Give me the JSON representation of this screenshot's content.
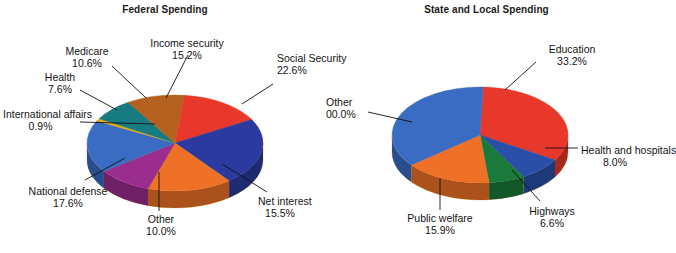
{
  "figure": {
    "background": "#ffffff",
    "rim_color": "#f3dfa9",
    "rim_shadow": "#e4c882",
    "leader_color": "#111111"
  },
  "charts": [
    {
      "id": "federal",
      "title": "Federal Spending",
      "type": "pie",
      "center_x": 175,
      "center_y": 143,
      "radius_x": 88,
      "radius_y": 48,
      "depth": 17,
      "start_angle": -84,
      "slices": [
        {
          "label": "Income security",
          "pct": "15.2%",
          "value": 15.2,
          "color": "#e8382b"
        },
        {
          "label": "Social Security",
          "pct": "22.6%",
          "value": 22.6,
          "color": "#2a3a9e"
        },
        {
          "label": "Net interest",
          "pct": "15.5%",
          "value": 15.5,
          "color": "#ee7127"
        },
        {
          "label": "Other",
          "pct": "10.0%",
          "value": 10.0,
          "color": "#9b2d8e"
        },
        {
          "label": "National defense",
          "pct": "17.6%",
          "value": 17.6,
          "color": "#3a6cc4"
        },
        {
          "label": "International affairs",
          "pct": "0.9%",
          "value": 0.9,
          "color": "#e8a90d"
        },
        {
          "label": "Health",
          "pct": "7.6%",
          "value": 7.6,
          "color": "#177b82"
        },
        {
          "label": "Medicare",
          "pct": "10.6%",
          "value": 10.6,
          "color": "#b4611f"
        }
      ]
    },
    {
      "id": "state",
      "title": "State and Local Spending",
      "type": "pie",
      "center_x": 480,
      "center_y": 135,
      "radius_x": 88,
      "radius_y": 48,
      "depth": 17,
      "start_angle": -88,
      "slices": [
        {
          "label": "Education",
          "pct": "33.2%",
          "value": 33.2,
          "color": "#e8382b"
        },
        {
          "label": "Health and hospitals",
          "pct": "8.0%",
          "value": 8.0,
          "color": "#2a4fa8"
        },
        {
          "label": "Highways",
          "pct": "6.6%",
          "value": 6.6,
          "color": "#1a7a3c"
        },
        {
          "label": "Public welfare",
          "pct": "15.9%",
          "value": 15.9,
          "color": "#ee7127"
        },
        {
          "label": "Other",
          "pct": "00.0%",
          "value": 36.3,
          "color": "#3a6cc4"
        }
      ]
    }
  ],
  "callouts": {
    "federal": [
      {
        "name": "income-security",
        "label": "Income security",
        "pct": "15.2%",
        "x": 139,
        "y": 38,
        "w": 96,
        "align": "center"
      },
      {
        "name": "social-security",
        "label": "Social Security",
        "pct": "22.6%",
        "x": 277,
        "y": 53,
        "w": 48,
        "align": "left"
      },
      {
        "name": "medicare",
        "label": "Medicare",
        "pct": "10.6%",
        "x": 56,
        "y": 46,
        "w": 62,
        "align": "center"
      },
      {
        "name": "health",
        "label": "Health",
        "pct": "7.6%",
        "x": 35,
        "y": 72,
        "w": 50,
        "align": "center"
      },
      {
        "name": "international-affairs",
        "label": "International affairs",
        "pct": "0.9%",
        "x": 3,
        "y": 109,
        "w": 75,
        "align": "center"
      },
      {
        "name": "national-defense",
        "label": "National defense",
        "pct": "17.6%",
        "x": 22,
        "y": 186,
        "w": 92,
        "align": "center"
      },
      {
        "name": "other",
        "label": "Other",
        "pct": "10.0%",
        "x": 139,
        "y": 214,
        "w": 44,
        "align": "center"
      },
      {
        "name": "net-interest",
        "label": "Net interest",
        "pct": "15.5%",
        "x": 258,
        "y": 196,
        "w": 44,
        "align": "center"
      }
    ],
    "state": [
      {
        "name": "education",
        "label": "Education",
        "pct": "33.2%",
        "x": 539,
        "y": 44,
        "w": 66,
        "align": "center"
      },
      {
        "name": "other",
        "label": "Other",
        "pct": "00.0%",
        "x": 326,
        "y": 97,
        "w": 44,
        "align": "left"
      },
      {
        "name": "health-and-hospitals",
        "label": "Health and hospitals",
        "pct": "8.0%",
        "x": 581,
        "y": 145,
        "w": 68,
        "align": "center"
      },
      {
        "name": "highways",
        "label": "Highways",
        "pct": "6.6%",
        "x": 524,
        "y": 206,
        "w": 56,
        "align": "center"
      },
      {
        "name": "public-welfare",
        "label": "Public welfare",
        "pct": "15.9%",
        "x": 400,
        "y": 213,
        "w": 80,
        "align": "center"
      }
    ]
  },
  "leader_lines": {
    "federal": [
      {
        "name": "leader-income-security",
        "x1": 188,
        "y1": 55,
        "x2": 166,
        "y2": 98
      },
      {
        "name": "leader-social-security",
        "x1": 273,
        "y1": 84,
        "x2": 242,
        "y2": 104
      },
      {
        "name": "leader-medicare",
        "x1": 112,
        "y1": 66,
        "x2": 146,
        "y2": 98
      },
      {
        "name": "leader-health",
        "x1": 80,
        "y1": 90,
        "x2": 117,
        "y2": 110
      },
      {
        "name": "leader-international",
        "x1": 80,
        "y1": 122,
        "x2": 155,
        "y2": 124
      },
      {
        "name": "leader-national-defense",
        "x1": 85,
        "y1": 180,
        "x2": 125,
        "y2": 158
      },
      {
        "name": "leader-other",
        "x1": 159,
        "y1": 211,
        "x2": 159,
        "y2": 172
      },
      {
        "name": "leader-net-interest",
        "x1": 267,
        "y1": 192,
        "x2": 222,
        "y2": 164
      }
    ],
    "state": [
      {
        "name": "leader-education",
        "x1": 536,
        "y1": 62,
        "x2": 505,
        "y2": 90
      },
      {
        "name": "leader-other",
        "x1": 368,
        "y1": 112,
        "x2": 412,
        "y2": 122
      },
      {
        "name": "leader-health-hospitals",
        "x1": 578,
        "y1": 148,
        "x2": 545,
        "y2": 148
      },
      {
        "name": "leader-highways",
        "x1": 540,
        "y1": 201,
        "x2": 512,
        "y2": 170
      },
      {
        "name": "leader-public-welfare",
        "x1": 440,
        "y1": 210,
        "x2": 440,
        "y2": 178
      }
    ]
  },
  "chart_data": [
    {
      "type": "pie",
      "title": "Federal Spending",
      "categories": [
        "Income security",
        "Social Security",
        "Net interest",
        "Other",
        "National defense",
        "International affairs",
        "Health",
        "Medicare"
      ],
      "values": [
        15.2,
        22.6,
        15.5,
        10.0,
        17.6,
        0.9,
        7.6,
        10.6
      ],
      "unit": "percent",
      "legend": "none",
      "labels": "callout with leader lines",
      "colors": [
        "#e8382b",
        "#2a3a9e",
        "#ee7127",
        "#9b2d8e",
        "#3a6cc4",
        "#e8a90d",
        "#177b82",
        "#b4611f"
      ]
    },
    {
      "type": "pie",
      "title": "State and Local Spending",
      "categories": [
        "Education",
        "Health and hospitals",
        "Highways",
        "Public welfare",
        "Other"
      ],
      "values": [
        33.2,
        8.0,
        6.6,
        15.9,
        36.3
      ],
      "value_labels": [
        "33.2%",
        "8.0%",
        "6.6%",
        "15.9%",
        "00.0%"
      ],
      "unit": "percent",
      "legend": "none",
      "labels": "callout with leader lines",
      "colors": [
        "#e8382b",
        "#2a4fa8",
        "#1a7a3c",
        "#ee7127",
        "#3a6cc4"
      ]
    }
  ]
}
